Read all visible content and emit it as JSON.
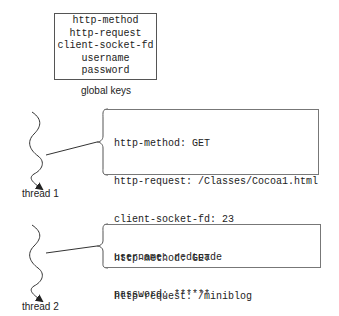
{
  "global_keys": {
    "items": [
      "http-method",
      "http-request",
      "client-socket-fd",
      "username",
      "password"
    ],
    "caption": "global keys"
  },
  "threads": [
    {
      "label": "thread 1",
      "entries": [
        "http-method: GET",
        "http-request: /Classes/Cocoa1.html",
        "client-socket-fd: 23",
        "username: redtoade",
        "password: ******"
      ]
    },
    {
      "label": "thread 2",
      "entries": [
        "http-method: GET",
        "http-request: /miniblog",
        "client-socket-fd: 42"
      ]
    }
  ],
  "colors": {
    "stroke": "#333333",
    "box_border": "#666666"
  }
}
